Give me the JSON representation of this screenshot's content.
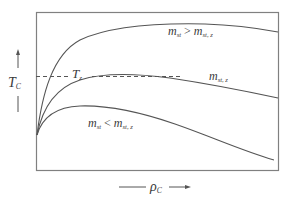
{
  "diagram": {
    "type": "qualitative line diagram",
    "axes": {
      "y": {
        "label_main": "T",
        "label_sub": "C",
        "direction": "up-arrow"
      },
      "x": {
        "label_main": "ρ",
        "label_sub": "C",
        "direction": "right-arrow"
      }
    },
    "reference_line": {
      "label_main": "T",
      "label_sub": "z",
      "style": "dashed"
    },
    "curves": [
      {
        "id": "high",
        "label_lhs": "m",
        "label_lhs_sub": "st",
        "operator": " > ",
        "label_rhs": "m",
        "label_rhs_sub": "st, z"
      },
      {
        "id": "mid",
        "label_lhs": "m",
        "label_lhs_sub": "st, z"
      },
      {
        "id": "low",
        "label_lhs": "m",
        "label_lhs_sub": "st",
        "operator": " < ",
        "label_rhs": "m",
        "label_rhs_sub": "st, z"
      }
    ],
    "colors": {
      "frame": "#7a7a7a",
      "curve": "#555555",
      "text": "#3a3a3a"
    }
  }
}
